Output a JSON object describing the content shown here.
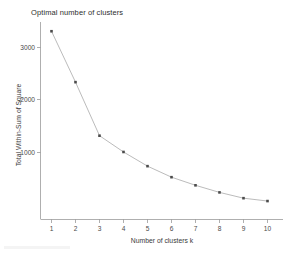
{
  "chart_data": {
    "type": "line",
    "title": "Optimal number of clusters",
    "xlabel": "Number of clusters k",
    "ylabel": "Total Within-Sum of Square",
    "x": [
      1,
      2,
      3,
      4,
      5,
      6,
      7,
      8,
      9,
      10
    ],
    "values": [
      3310,
      2340,
      1320,
      1010,
      740,
      530,
      375,
      240,
      130,
      75
    ],
    "xticklabels": [
      "1",
      "2",
      "3",
      "4",
      "5",
      "6",
      "7",
      "8",
      "9",
      "10"
    ],
    "yticklabels": [
      "1000",
      "2000",
      "3000"
    ],
    "yticks": [
      1000,
      2000,
      3000
    ],
    "xlim": [
      0.6,
      10.5
    ],
    "ylim": [
      0,
      3600
    ],
    "grid": false,
    "legend": false,
    "marker": "square",
    "line_color": "#a9a9a9",
    "marker_color": "#4b4b4b",
    "axis_color": "#8d8d8d",
    "background": "#ffffff"
  }
}
